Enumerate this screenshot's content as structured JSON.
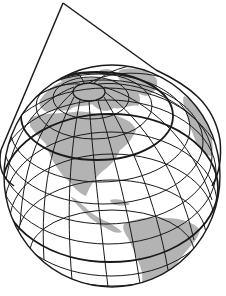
{
  "figure": {
    "title": "",
    "description_visible_text": [],
    "colors": {
      "background": "#ffffff",
      "land": "#b3b3b3",
      "ocean": "#ffffff",
      "lines": "#1a1a1a"
    },
    "elements": {
      "globe": {
        "cx": 112,
        "cy": 176,
        "rx": 108,
        "ry": 111
      },
      "pole_cap": {
        "cx": 89,
        "cy": 92,
        "rx": 16,
        "ry": 9
      },
      "cone": {
        "apex": [
          63,
          3
        ],
        "left_end": [
          0,
          150
        ],
        "right_end": [
          156,
          70
        ]
      },
      "tangent_parallel": "thick latitude circle where cone touches globe",
      "equator": "thick latitude line crossing lower globe",
      "continents": [
        "North America",
        "Central America",
        "South America",
        "Greenland",
        "Europe (edge)"
      ]
    }
  }
}
